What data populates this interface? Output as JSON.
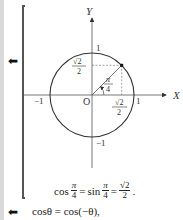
{
  "margin_arrows": [
    {
      "icon": "left-arrow-icon",
      "glyph": "⬅"
    },
    {
      "icon": "left-arrow-icon",
      "glyph": "⬅"
    }
  ],
  "figure": {
    "axis_labels": {
      "x": "X",
      "y": "Y",
      "origin": "O"
    },
    "ticks": {
      "x_pos": "1",
      "x_neg": "−1",
      "y_pos": "1",
      "y_neg": "−1"
    },
    "point_y_label": {
      "num": "√2",
      "den": "2"
    },
    "point_x_label": {
      "num": "√2",
      "den": "2"
    },
    "angle_label": {
      "num": "π",
      "den": "4"
    }
  },
  "formula": {
    "cos": "cos",
    "pi1": {
      "num": "π",
      "den": "4"
    },
    "eq1": "=",
    "sin": "sin",
    "pi2": {
      "num": "π",
      "den": "4"
    },
    "eq2": "=",
    "result": {
      "num": "√2",
      "den": "2"
    },
    "end": "."
  },
  "bottom_equation": "cosθ = cos(−θ),"
}
